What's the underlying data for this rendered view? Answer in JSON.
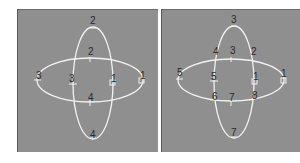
{
  "colors": {
    "background": "#ffffff",
    "viewport": "#8f8f8f",
    "curve": "#f2f2f2",
    "label": "#2a2a2a"
  },
  "panels": [
    {
      "id": "left",
      "description": "Two intersecting ellipses before merge, each with 4 vertices",
      "labels": [
        {
          "text": "2",
          "x": 94,
          "y": 24
        },
        {
          "text": "2",
          "x": 92,
          "y": 54
        },
        {
          "text": "3",
          "x": 40,
          "y": 78
        },
        {
          "text": "3",
          "x": 73,
          "y": 78
        },
        {
          "text": "1",
          "x": 114,
          "y": 78
        },
        {
          "text": "1",
          "x": 141,
          "y": 77
        },
        {
          "text": "4",
          "x": 91,
          "y": 100
        },
        {
          "text": "4",
          "x": 93,
          "y": 136
        }
      ]
    },
    {
      "id": "right",
      "description": "Ellipses after boolean/intersection with 8 vertices",
      "labels": [
        {
          "text": "3",
          "x": 234,
          "y": 22
        },
        {
          "text": "4",
          "x": 216,
          "y": 53
        },
        {
          "text": "3",
          "x": 233,
          "y": 52
        },
        {
          "text": "2",
          "x": 254,
          "y": 53
        },
        {
          "text": "5",
          "x": 180,
          "y": 74
        },
        {
          "text": "5",
          "x": 214,
          "y": 78
        },
        {
          "text": "1",
          "x": 255,
          "y": 76
        },
        {
          "text": "1",
          "x": 283,
          "y": 74
        },
        {
          "text": "6",
          "x": 216,
          "y": 99
        },
        {
          "text": "7",
          "x": 233,
          "y": 100
        },
        {
          "text": "8",
          "x": 255,
          "y": 98
        },
        {
          "text": "7",
          "x": 234,
          "y": 135
        }
      ]
    }
  ]
}
